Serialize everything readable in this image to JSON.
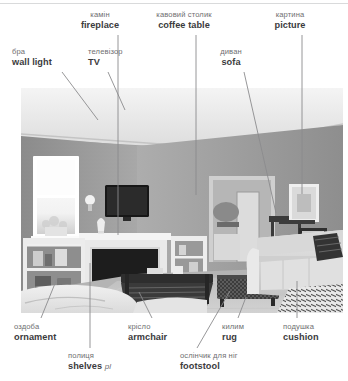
{
  "image": {
    "alt": "grayscale photo of a living room interior",
    "description": "living-room-photo"
  },
  "colors": {
    "uk_text": "#6e6e70",
    "en_text": "#3b3b3d",
    "leader_line": "#8b8b8d",
    "rule": "#d9dadb",
    "background": "#ffffff"
  },
  "labels": [
    {
      "id": "wall-light",
      "uk": "бра",
      "en": "wall light",
      "pl": "",
      "x": 12,
      "y": 48,
      "align": "lft"
    },
    {
      "id": "tv",
      "uk": "телевізор",
      "en": "TV",
      "pl": "",
      "x": 88,
      "y": 48,
      "align": "lft"
    },
    {
      "id": "fireplace",
      "uk": "камін",
      "en": "fireplace",
      "pl": "",
      "x": 100,
      "y": 11,
      "align": "ctr"
    },
    {
      "id": "coffee-table",
      "uk": "кавовий столик",
      "en": "coffee table",
      "pl": "",
      "x": 184,
      "y": 11,
      "align": "ctr"
    },
    {
      "id": "sofa",
      "uk": "диван",
      "en": "sofa",
      "pl": "",
      "x": 231,
      "y": 48,
      "align": "ctr"
    },
    {
      "id": "picture",
      "uk": "картина",
      "en": "picture",
      "pl": "",
      "x": 290,
      "y": 11,
      "align": "ctr"
    },
    {
      "id": "ornament",
      "uk": "оздоба",
      "en": "ornament",
      "pl": "",
      "x": 14,
      "y": 323,
      "align": "lft"
    },
    {
      "id": "shelves",
      "uk": "полиця",
      "en": "shelves",
      "pl": "pl",
      "x": 68,
      "y": 352,
      "align": "lft"
    },
    {
      "id": "armchair",
      "uk": "крісло",
      "en": "armchair",
      "pl": "",
      "x": 128,
      "y": 323,
      "align": "lft"
    },
    {
      "id": "footstool",
      "uk": "ослінчик для ніг",
      "en": "footstool",
      "pl": "",
      "x": 180,
      "y": 352,
      "align": "lft"
    },
    {
      "id": "rug",
      "uk": "килим",
      "en": "rug",
      "pl": "",
      "x": 222,
      "y": 323,
      "align": "lft"
    },
    {
      "id": "cushion",
      "uk": "подушка",
      "en": "cushion",
      "pl": "",
      "x": 283,
      "y": 323,
      "align": "lft"
    }
  ],
  "leaders": [
    {
      "id": "leader-wall-light",
      "x1": 62,
      "y1": 72,
      "x2": 98,
      "y2": 120
    },
    {
      "id": "leader-tv",
      "x1": 108,
      "y1": 72,
      "x2": 125,
      "y2": 110
    },
    {
      "id": "leader-fireplace",
      "x1": 118,
      "y1": 35,
      "x2": 118,
      "y2": 235
    },
    {
      "id": "leader-coffee-table",
      "x1": 196,
      "y1": 35,
      "x2": 196,
      "y2": 195
    },
    {
      "id": "leader-sofa",
      "x1": 244,
      "y1": 72,
      "x2": 276,
      "y2": 213
    },
    {
      "id": "leader-picture",
      "x1": 302,
      "y1": 35,
      "x2": 302,
      "y2": 194
    },
    {
      "id": "leader-ornament",
      "x1": 41,
      "y1": 318,
      "x2": 58,
      "y2": 276
    },
    {
      "id": "leader-shelves",
      "x1": 90,
      "y1": 348,
      "x2": 90,
      "y2": 263
    },
    {
      "id": "leader-armchair",
      "x1": 152,
      "y1": 318,
      "x2": 139,
      "y2": 292
    },
    {
      "id": "leader-footstool",
      "x1": 197,
      "y1": 348,
      "x2": 230,
      "y2": 291
    },
    {
      "id": "leader-rug",
      "x1": 238,
      "y1": 318,
      "x2": 246,
      "y2": 297
    },
    {
      "id": "leader-cushion",
      "x1": 297,
      "y1": 318,
      "x2": 297,
      "y2": 281
    }
  ]
}
